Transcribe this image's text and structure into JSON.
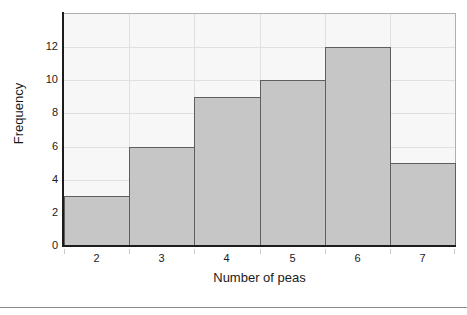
{
  "chart_data": {
    "type": "bar",
    "title": "",
    "xlabel": "Number of peas",
    "ylabel": "Frequency",
    "categories": [
      "2",
      "3",
      "4",
      "5",
      "6",
      "7"
    ],
    "values": [
      3,
      6,
      9,
      10,
      12,
      5
    ],
    "ylim": [
      0,
      14
    ],
    "yticks": [
      0,
      2,
      4,
      6,
      8,
      10,
      12
    ],
    "ytick_labels": [
      "0",
      "2",
      "4",
      "6",
      "8",
      "10",
      "12"
    ],
    "xtick_labels": [
      "2",
      "3",
      "4",
      "5",
      "6",
      "7"
    ],
    "grid": true,
    "legend": false,
    "bar_fill": "#c6c6c6",
    "bar_edge": "#5e5e5e",
    "plot_background": "#f7f7f7",
    "gridline_color": "#e0e0e0",
    "axis_color": "#1c1c1c"
  },
  "figure": {
    "page_background": "#ffffff",
    "rule_color": "#8a8a8a"
  }
}
